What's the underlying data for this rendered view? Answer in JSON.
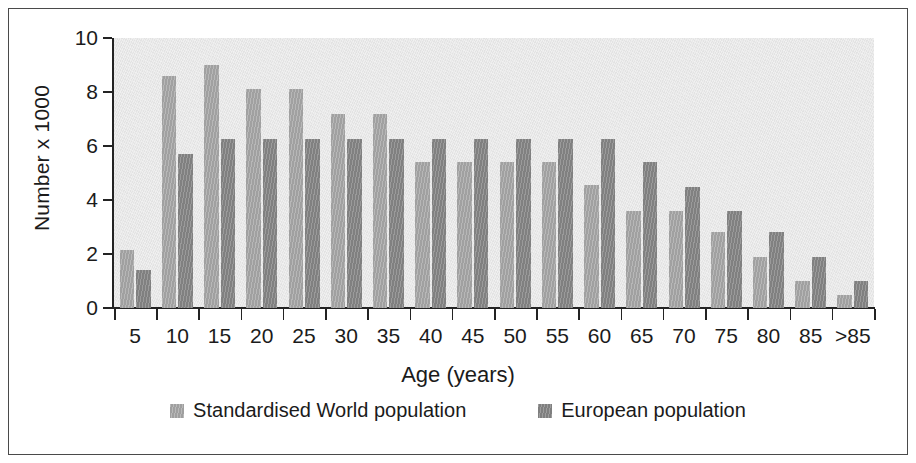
{
  "figure": {
    "background_color": "#ffffff",
    "frame_color": "#4a4a4a",
    "plot_background_color": "#e9e9e9"
  },
  "axes": {
    "y_title": "Number x 1000",
    "x_title": "Age (years)",
    "y_ticks": [
      "0",
      "2",
      "4",
      "6",
      "8",
      "10"
    ],
    "x_ticks": [
      "5",
      "10",
      "15",
      "20",
      "25",
      "30",
      "35",
      "40",
      "45",
      "50",
      "55",
      "60",
      "65",
      "70",
      "75",
      "80",
      "85",
      ">85"
    ]
  },
  "legend": {
    "items": [
      {
        "label": "Standardised World population",
        "color": "#a9a9a9"
      },
      {
        "label": "European population",
        "color": "#878787"
      }
    ]
  },
  "chart_data": {
    "type": "bar",
    "title": "",
    "xlabel": "Age (years)",
    "ylabel": "Number x 1000",
    "ylim": [
      0,
      10
    ],
    "ytick_step": 2,
    "grid": false,
    "legend_position": "bottom",
    "categories": [
      "5",
      "10",
      "15",
      "20",
      "25",
      "30",
      "35",
      "40",
      "45",
      "50",
      "55",
      "60",
      "65",
      "70",
      "75",
      "80",
      "85",
      ">85"
    ],
    "series": [
      {
        "name": "Standardised World population",
        "color": "#a9a9a9",
        "values": [
          2.15,
          8.6,
          9.0,
          8.1,
          8.1,
          7.2,
          7.2,
          5.4,
          5.4,
          5.4,
          5.4,
          4.55,
          3.6,
          3.6,
          2.8,
          1.9,
          1.0,
          0.5
        ]
      },
      {
        "name": "European population",
        "color": "#878787",
        "values": [
          1.4,
          5.7,
          6.25,
          6.25,
          6.25,
          6.25,
          6.25,
          6.25,
          6.25,
          6.25,
          6.25,
          6.25,
          5.4,
          4.5,
          3.6,
          2.8,
          1.9,
          1.0
        ]
      }
    ]
  }
}
